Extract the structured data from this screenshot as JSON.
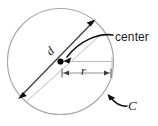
{
  "figure": {
    "kind": "geometry-diagram",
    "background_color": "#ffffff"
  },
  "labels": {
    "center": "center",
    "curve": "C",
    "radius": "r",
    "diameter": "d"
  },
  "icons": {
    "center_point": "filled-dot-icon",
    "center_leader": "curved-arrow-icon",
    "curve_leader": "curved-arrow-icon",
    "diameter_arrow_start": "arrowhead-icon",
    "diameter_arrow_end": "arrowhead-icon",
    "radius_tick_left": "dimension-tick-icon",
    "radius_tick_right": "dimension-tick-icon"
  },
  "colors": {
    "circle_stroke": "#a8a8a8",
    "diameter_stroke": "#3a3a3a",
    "guide_stroke": "#b5b5b5",
    "dimension_stroke": "#9a9a9a",
    "arrow_fill": "#101010",
    "text": "#1a1a1a"
  },
  "geometry": {
    "circle_center_x": 60.5,
    "circle_center_y": 61.5,
    "circle_radius": 53,
    "diameter_angle_deg": -42,
    "radius_dimension_y": 73,
    "radius_dimension_x_start": 61,
    "radius_dimension_x_end": 112
  }
}
